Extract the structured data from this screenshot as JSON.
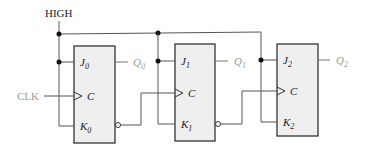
{
  "diagram": {
    "supply_label": "HIGH",
    "clock_label": "CLK",
    "flipflops": [
      {
        "j": "J",
        "j_sub": "0",
        "c": "C",
        "k": "K",
        "k_sub": "0",
        "q": "Q",
        "q_sub": "0"
      },
      {
        "j": "J",
        "j_sub": "1",
        "c": "C",
        "k": "K",
        "k_sub": "1",
        "q": "Q",
        "q_sub": "1"
      },
      {
        "j": "J",
        "j_sub": "2",
        "c": "C",
        "k": "K",
        "k_sub": "2",
        "q": "Q",
        "q_sub": "2"
      }
    ],
    "colors": {
      "box_fill": "#efefef",
      "box_stroke": "#333333",
      "wire": "#555555",
      "output_text": "#999999",
      "label_text": "#222222"
    }
  }
}
